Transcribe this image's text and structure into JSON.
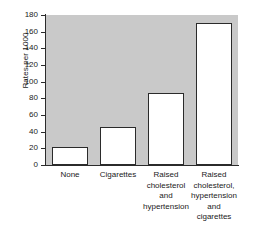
{
  "chart_data": {
    "type": "bar",
    "title": "",
    "xlabel": "",
    "ylabel": "Rates per 1000",
    "categories": [
      "None",
      "Cigarettes",
      "Raised\ncholesterol\nand\nhypertension",
      "Raised\ncholesterol,\nhypertension\nand\ncigarettes"
    ],
    "values": [
      22,
      46,
      86,
      171
    ],
    "ylim": [
      0,
      180
    ],
    "ytick_labels": [
      "0",
      "20",
      "40",
      "60",
      "80",
      "100",
      "120",
      "140",
      "160",
      "180"
    ],
    "ytick_values": [
      0,
      20,
      40,
      60,
      80,
      100,
      120,
      140,
      160,
      180
    ],
    "grid": false,
    "legend": null,
    "plot_background_color": "#c9c9c9",
    "bar_fill_color": "#ffffff",
    "bar_edge_color": "#2b2b2b",
    "axis_color": "#2b2b2b"
  }
}
